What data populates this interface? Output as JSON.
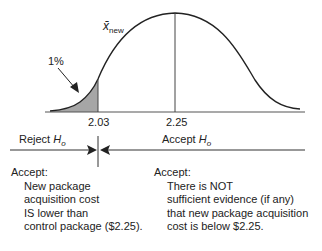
{
  "diagram": {
    "curve_label_symbol": "x̄",
    "curve_label_subscript": "new",
    "tail_area_label": "1%",
    "critical_value": "2.03",
    "mean_value": "2.25",
    "reject_label": "Reject",
    "accept_label": "Accept",
    "hypothesis_symbol": "H",
    "hypothesis_subscript": "o",
    "left_conclusion": {
      "heading": "Accept:",
      "lines": [
        "New package",
        "acquisition cost",
        "IS lower than",
        "control package ($2.25)."
      ]
    },
    "right_conclusion": {
      "heading": "Accept:",
      "lines": [
        "There is NOT",
        "sufficient evidence (if any)",
        "that new package acquisition",
        "cost is below $2.25."
      ]
    },
    "colors": {
      "line": "#222222",
      "shaded_tail": "#a6a6a6",
      "axis": "#555555"
    }
  }
}
